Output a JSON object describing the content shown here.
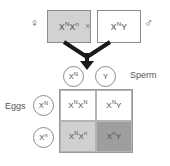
{
  "diagram": {
    "cross_symbol": "×",
    "colors": {
      "carrier_fill": "#d0d0d0",
      "affected_fill": "#9e9e9e",
      "unaffected_fill": "#ffffff",
      "outline": "#8c8c8c"
    }
  },
  "parents": {
    "female": {
      "sex_symbol": "♀",
      "sex_name": "female",
      "allele1": "X",
      "allele1_sup": "N",
      "allele2": "X",
      "allele2_sup": "n",
      "shaded": true
    },
    "male": {
      "sex_symbol": "♂",
      "sex_name": "male",
      "allele1": "X",
      "allele1_sup": "N",
      "allele2": "Y",
      "allele2_sup": "",
      "shaded": false
    }
  },
  "gametes": {
    "sperm_label": "Sperm",
    "eggs_label": "Eggs",
    "sperm": [
      {
        "allele": "X",
        "sup": "N"
      },
      {
        "allele": "Y",
        "sup": ""
      }
    ],
    "eggs": [
      {
        "allele": "X",
        "sup": "N"
      },
      {
        "allele": "X",
        "sup": "n"
      }
    ]
  },
  "punnett": {
    "cells": [
      {
        "row": 0,
        "col": 0,
        "a1": "X",
        "a1_sup": "N",
        "a2": "X",
        "a2_sup": "N",
        "fill": "white",
        "phenotype": "unaffected-female"
      },
      {
        "row": 0,
        "col": 1,
        "a1": "X",
        "a1_sup": "N",
        "a2": "Y",
        "a2_sup": "",
        "fill": "white",
        "phenotype": "unaffected-male"
      },
      {
        "row": 1,
        "col": 0,
        "a1": "X",
        "a1_sup": "N",
        "a2": "X",
        "a2_sup": "n",
        "fill": "light",
        "phenotype": "carrier-female"
      },
      {
        "row": 1,
        "col": 1,
        "a1": "X",
        "a1_sup": "n",
        "a2": "Y",
        "a2_sup": "",
        "fill": "dark",
        "phenotype": "affected-male"
      }
    ]
  }
}
